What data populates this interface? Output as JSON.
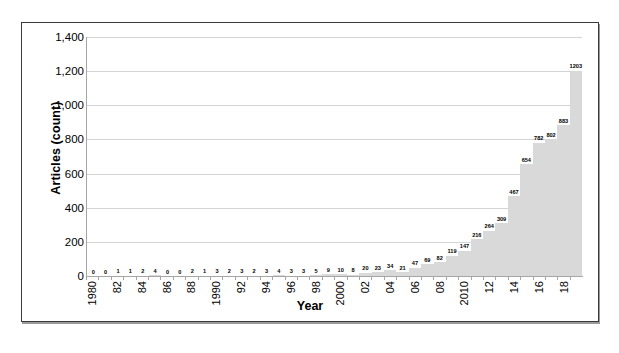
{
  "figure": {
    "background_color": "#ffffff",
    "frame_border_color": "#3a3a3a"
  },
  "chart_data": {
    "type": "bar",
    "title": "",
    "subtitle": "",
    "xlabel": "Year",
    "ylabel": "Articles (count)",
    "ylim": [
      0,
      1400
    ],
    "ytick_values": [
      0,
      200,
      400,
      600,
      800,
      1000,
      1200,
      1400
    ],
    "ytick_labels": [
      "0",
      "200",
      "400",
      "600",
      "800",
      "1,000",
      "1,200",
      "1,400"
    ],
    "grid": true,
    "grid_axis": "y",
    "grid_color": "#d4d4d4",
    "legend": false,
    "legend_position": "none",
    "bar_color": "#d9d9d9",
    "bar_gap": 0,
    "data_labels": true,
    "categories": [
      "1980",
      "1981",
      "1982",
      "1983",
      "1984",
      "1985",
      "1986",
      "1987",
      "1988",
      "1989",
      "1990",
      "1991",
      "1992",
      "1993",
      "1994",
      "1995",
      "1996",
      "1997",
      "1998",
      "1999",
      "2000",
      "2001",
      "2002",
      "2003",
      "2004",
      "2005",
      "2006",
      "2007",
      "2008",
      "2009",
      "2010",
      "2011",
      "2012",
      "2013",
      "2014",
      "2015",
      "2016",
      "2017",
      "2018",
      "2019"
    ],
    "xtick_labels": [
      "1980",
      "",
      "82",
      "",
      "84",
      "",
      "86",
      "",
      "88",
      "",
      "1990",
      "",
      "92",
      "",
      "94",
      "",
      "96",
      "",
      "98",
      "",
      "2000",
      "",
      "02",
      "",
      "04",
      "",
      "06",
      "",
      "08",
      "",
      "2010",
      "",
      "12",
      "",
      "14",
      "",
      "16",
      "",
      "18",
      ""
    ],
    "values": [
      0,
      0,
      1,
      1,
      2,
      4,
      0,
      0,
      2,
      1,
      3,
      2,
      3,
      2,
      3,
      4,
      3,
      3,
      5,
      9,
      10,
      8,
      20,
      23,
      34,
      21,
      47,
      69,
      82,
      119,
      147,
      216,
      264,
      309,
      467,
      654,
      782,
      802,
      883,
      1203
    ],
    "value_labels": [
      "0",
      "0",
      "1",
      "1",
      "2",
      "4",
      "0",
      "0",
      "2",
      "1",
      "3",
      "2",
      "3",
      "2",
      "3",
      "4",
      "3",
      "3",
      "5",
      "9",
      "10",
      "8",
      "20",
      "23",
      "34",
      "21",
      "47",
      "69",
      "82",
      "119",
      "147",
      "216",
      "264",
      "309",
      "467",
      "654",
      "782",
      "802",
      "883",
      "1203"
    ]
  }
}
